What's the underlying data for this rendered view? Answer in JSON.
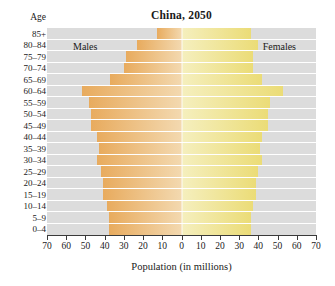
{
  "chart_data": {
    "type": "bar",
    "subtype": "population-pyramid",
    "title": "China, 2050",
    "xlabel": "Population (in millions)",
    "ylabel": "Age",
    "grid": false,
    "legend_position": "in-plot",
    "xlim": [
      -70,
      70
    ],
    "x_axis_max": 70,
    "xticks": [
      70,
      60,
      50,
      40,
      30,
      20,
      10,
      0,
      10,
      20,
      30,
      40,
      50,
      60,
      70
    ],
    "categories": [
      "85+",
      "80–84",
      "75–79",
      "70–74",
      "65–69",
      "60–64",
      "55–59",
      "50–54",
      "45–49",
      "40–44",
      "35–39",
      "30–34",
      "25–29",
      "20–24",
      "15–19",
      "10–14",
      "5–9",
      "0–4"
    ],
    "series": [
      {
        "name": "Males",
        "side": "left",
        "color": "#e8ab5e",
        "values": [
          13,
          23,
          29,
          30,
          37,
          52,
          48,
          47,
          47,
          44,
          43,
          44,
          42,
          41,
          41,
          39,
          38,
          38
        ]
      },
      {
        "name": "Females",
        "side": "right",
        "color": "#ebdc77",
        "values": [
          36,
          40,
          37,
          37,
          42,
          53,
          46,
          45,
          45,
          42,
          41,
          42,
          40,
          39,
          39,
          37,
          36,
          36
        ]
      }
    ]
  },
  "labels": {
    "males": "Males",
    "females": "Females"
  }
}
